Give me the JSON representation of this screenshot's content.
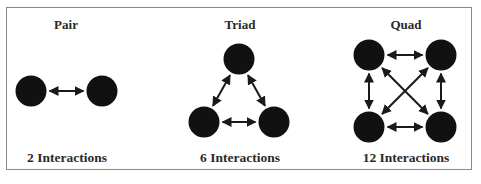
{
  "figure": {
    "panels": [
      {
        "id": "pair",
        "title": "Pair",
        "caption": "2 Interactions",
        "nodes": [
          [
            31,
            91
          ],
          [
            102,
            91
          ]
        ],
        "edges": [
          [
            0,
            1
          ]
        ]
      },
      {
        "id": "triad",
        "title": "Triad",
        "caption": "6 Interactions",
        "nodes": [
          [
            239,
            59
          ],
          [
            204,
            122
          ],
          [
            274,
            122
          ]
        ],
        "edges": [
          [
            0,
            1
          ],
          [
            0,
            2
          ],
          [
            1,
            2
          ]
        ]
      },
      {
        "id": "quad",
        "title": "Quad",
        "caption": "12 Interactions",
        "nodes": [
          [
            369,
            55
          ],
          [
            441,
            55
          ],
          [
            369,
            127
          ],
          [
            441,
            127
          ]
        ],
        "edges": [
          [
            0,
            1
          ],
          [
            2,
            3
          ],
          [
            0,
            2
          ],
          [
            1,
            3
          ],
          [
            0,
            3
          ],
          [
            1,
            2
          ]
        ]
      }
    ],
    "colors": {
      "node": "#111111",
      "arrow": "#1a1a1a",
      "frame": "#8a8a8a"
    }
  }
}
